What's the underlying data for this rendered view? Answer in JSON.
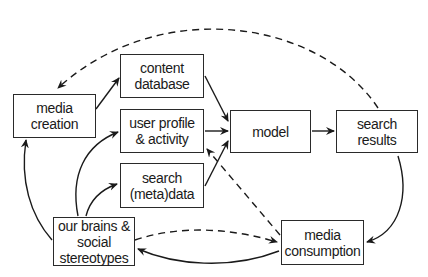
{
  "nodes": {
    "media_creation": {
      "line1": "media",
      "line2": "creation"
    },
    "content_database": {
      "line1": "content",
      "line2": "database"
    },
    "user_profile": {
      "line1": "user profile",
      "line2": "& activity"
    },
    "search_metadata": {
      "line1": "search",
      "line2": "(meta)data"
    },
    "model": {
      "line1": "model"
    },
    "search_results": {
      "line1": "search",
      "line2": "results"
    },
    "brains": {
      "line1": "our brains &",
      "line2": "social",
      "line3": "stereotypes"
    },
    "media_consumption": {
      "line1": "media",
      "line2": "consumption"
    }
  },
  "edges": [
    {
      "from": "media_creation",
      "to": "content_database",
      "style": "solid"
    },
    {
      "from": "content_database",
      "to": "model",
      "style": "solid"
    },
    {
      "from": "user_profile",
      "to": "model",
      "style": "solid"
    },
    {
      "from": "search_metadata",
      "to": "model",
      "style": "solid"
    },
    {
      "from": "model",
      "to": "search_results",
      "style": "solid"
    },
    {
      "from": "search_results",
      "to": "media_consumption",
      "style": "solid"
    },
    {
      "from": "media_consumption",
      "to": "brains",
      "style": "solid"
    },
    {
      "from": "brains",
      "to": "media_creation",
      "style": "solid"
    },
    {
      "from": "brains",
      "to": "user_profile",
      "style": "solid"
    },
    {
      "from": "brains",
      "to": "search_metadata",
      "style": "solid"
    },
    {
      "from": "search_results",
      "to": "media_creation",
      "style": "dashed"
    },
    {
      "from": "media_consumption",
      "to": "user_profile",
      "style": "dashed"
    },
    {
      "from": "brains",
      "to": "media_consumption",
      "style": "dashed"
    }
  ]
}
